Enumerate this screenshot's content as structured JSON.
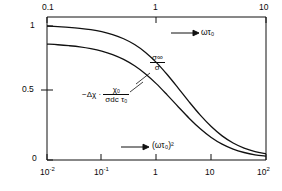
{
  "chart_data": {
    "type": "line",
    "title": "",
    "xlabel_bottom": "(ωτ₀)²",
    "xlabel_top": "ωτ₀",
    "ylabel": "",
    "x_scale": "log",
    "y_scale": "linear",
    "ylim": [
      0,
      1
    ],
    "xlim_bottom": [
      0.01,
      100
    ],
    "xlim_top": [
      0.1,
      10
    ],
    "grid": false,
    "legend_position": "inline-annotations",
    "bottom_ticks": [
      "10⁻²",
      "10⁻¹",
      "1",
      "10",
      "10²"
    ],
    "bottom_tick_values": [
      0.01,
      0.1,
      1,
      10,
      100
    ],
    "top_ticks": [
      "0.1",
      "1",
      "10"
    ],
    "top_tick_values": [
      0.1,
      1,
      10
    ],
    "y_ticks": [
      "0",
      "0.5",
      "1"
    ],
    "y_tick_values": [
      0,
      0.5,
      1
    ],
    "series": [
      {
        "name": "σ∞/σ",
        "label": "sigma-infinity-over-sigma",
        "y0": 1.0,
        "x": [
          0.01,
          0.0158,
          0.0251,
          0.0398,
          0.0631,
          0.1,
          0.158,
          0.251,
          0.398,
          0.631,
          1.0,
          1.58,
          2.51,
          3.98,
          6.31,
          10,
          15.8,
          25.1,
          39.8,
          63.1,
          100
        ],
        "values": [
          1.0,
          0.995,
          0.99,
          0.983,
          0.973,
          0.958,
          0.936,
          0.905,
          0.862,
          0.803,
          0.727,
          0.636,
          0.535,
          0.432,
          0.335,
          0.25,
          0.18,
          0.127,
          0.089,
          0.063,
          0.047
        ]
      },
      {
        "name": "−Δχ·χ₀/(σdc τ₀)",
        "label": "delta-chi-curve",
        "y0": 0.865,
        "x": [
          0.01,
          0.0158,
          0.0251,
          0.0398,
          0.0631,
          0.1,
          0.158,
          0.251,
          0.398,
          0.631,
          1.0,
          1.58,
          2.51,
          3.98,
          6.31,
          10,
          15.8,
          25.1,
          39.8,
          63.1,
          100
        ],
        "values": [
          0.865,
          0.86,
          0.853,
          0.844,
          0.831,
          0.813,
          0.787,
          0.751,
          0.703,
          0.642,
          0.568,
          0.484,
          0.396,
          0.31,
          0.233,
          0.168,
          0.118,
          0.081,
          0.056,
          0.039,
          0.029
        ]
      }
    ],
    "annotations": [
      {
        "name": "sigma-ratio-annotation",
        "num": "σ∞",
        "den": "σ",
        "x_px": 151,
        "y_px": 58
      },
      {
        "name": "delta-chi-annotation",
        "prefix": "−Δχ ·",
        "num": "χ₀",
        "den": "σdc τ₀",
        "x_px": 84,
        "y_px": 88
      },
      {
        "name": "top-axis-arrow-label",
        "text": "ωτ₀",
        "x_px": 197,
        "y_px": 29
      },
      {
        "name": "bottom-axis-arrow-label",
        "text": "(ωτ₀)²",
        "x_px": 148,
        "y_px": 142
      }
    ]
  },
  "axes": {
    "y_labels": [
      {
        "text": "1",
        "x_px": 30,
        "y_px": 24
      },
      {
        "text": "0.5",
        "x_px": 24,
        "y_px": 86
      },
      {
        "text": "0",
        "x_px": 32,
        "y_px": 154
      }
    ],
    "top_labels": [
      {
        "text": "0.1",
        "x_px": 45,
        "y_px": 3
      },
      {
        "text": "1",
        "x_px": 140,
        "y_px": 3
      },
      {
        "text": "10",
        "x_px": 240,
        "y_px": 3
      }
    ],
    "bottom_labels": [
      {
        "base": "10",
        "exp": "-2",
        "x_px": 38,
        "y_px": 165
      },
      {
        "base": "10",
        "exp": "-1",
        "x_px": 91,
        "y_px": 165
      },
      {
        "base": "1",
        "exp": "",
        "x_px": 147,
        "y_px": 165
      },
      {
        "base": "10",
        "exp": "",
        "x_px": 196,
        "y_px": 165
      },
      {
        "base": "10",
        "exp": "2",
        "x_px": 248,
        "y_px": 165
      }
    ]
  },
  "colors": {
    "axis": "#111111",
    "curve": "#111111",
    "background": "#ffffff"
  }
}
